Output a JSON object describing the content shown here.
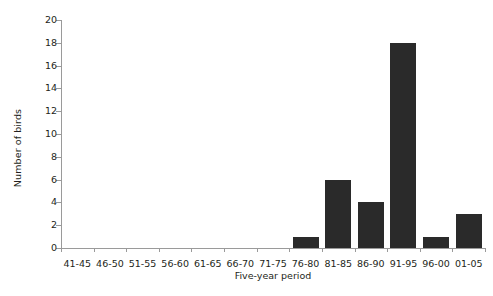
{
  "chart_data": {
    "type": "bar",
    "title": "",
    "subtitle": "",
    "xlabel": "Five-year period",
    "ylabel": "Number of birds",
    "categories": [
      "41-45",
      "46-50",
      "51-55",
      "56-60",
      "61-65",
      "66-70",
      "71-75",
      "76-80",
      "81-85",
      "86-90",
      "91-95",
      "96-00",
      "01-05"
    ],
    "values": [
      0,
      0,
      0,
      0,
      0,
      0,
      0,
      1,
      6,
      4,
      18,
      1,
      3
    ],
    "ylim": [
      0,
      20
    ],
    "ytick_step": 2,
    "yticks": [
      0,
      2,
      4,
      6,
      8,
      10,
      12,
      14,
      16,
      18,
      20
    ],
    "ytick_labels": [
      "0",
      "2",
      "4",
      "6",
      "8",
      "10",
      "12",
      "14",
      "16",
      "18",
      "20"
    ],
    "grid": false,
    "legend": null,
    "legend_position": "none",
    "bar_color": "#2a2a2a",
    "axis_color": "#9a9a9a",
    "text_color": "#231f20",
    "background_color": "#ffffff",
    "annotations": []
  }
}
